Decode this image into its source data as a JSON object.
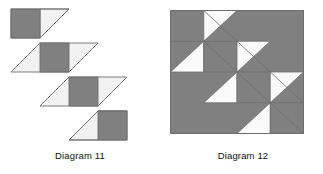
{
  "page": {
    "background": "#ffffff",
    "width": 323,
    "height": 174
  },
  "palette": {
    "dark_fill": "#808080",
    "light_fill": "#f2f2f2",
    "white_fill": "#ffffff",
    "outline": "#6e6e6e",
    "text": "#111111"
  },
  "figures": [
    {
      "id": "diagram-11",
      "caption": "Diagram 11",
      "type": "staircase-of-parallelogram-strips",
      "strip_count": 4,
      "description": "Four diagonally offset parallelogram strips descending left-to-right; each strip contains a dark shaded square with light right-triangles attached",
      "origin": {
        "x": 11,
        "y": 9
      },
      "cell": {
        "width": 29,
        "height": 29
      },
      "strip_offset": {
        "dx": 29,
        "dy": 34
      },
      "strips": [
        {
          "index": 1,
          "left_triangle": false,
          "square": true,
          "right_triangle": true
        },
        {
          "index": 2,
          "left_triangle": true,
          "square": true,
          "right_triangle": true
        },
        {
          "index": 3,
          "left_triangle": true,
          "square": true,
          "right_triangle": true
        },
        {
          "index": 4,
          "left_triangle": true,
          "square": true,
          "right_triangle": false
        }
      ]
    },
    {
      "id": "diagram-12",
      "caption": "Diagram 12",
      "type": "assembled-square-block",
      "description": "The four strips of Diagram 11 assembled into a single square block with shaded background corners",
      "origin": {
        "x": 170,
        "y": 10
      },
      "size": {
        "width": 133,
        "height": 123
      },
      "grid": {
        "columns": 4,
        "rows": 4
      },
      "cell": {
        "width": 33.25,
        "height": 30.75
      },
      "dark_squares": [
        {
          "row": 0,
          "col": 0
        },
        {
          "row": 1,
          "col": 1
        },
        {
          "row": 2,
          "col": 2
        },
        {
          "row": 3,
          "col": 3
        }
      ],
      "light_triangles": 7,
      "background_regions": [
        "upper-right shaded region",
        "lower-left shaded region"
      ]
    }
  ],
  "captions": {
    "diagram_11": "Diagram 11",
    "diagram_12": "Diagram 12"
  }
}
